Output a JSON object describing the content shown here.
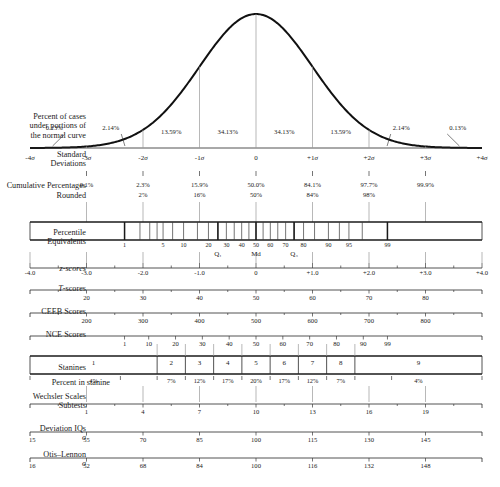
{
  "figure": {
    "geometry": {
      "x_left_sigma": -4,
      "x_right_sigma": 4,
      "plot_left_px": 30,
      "plot_right_px": 482,
      "baseline_y_px": 148
    }
  },
  "rows": {
    "percent_of_cases": {
      "label_lines": [
        "Percent of cases",
        "under portions of",
        "the normal curve"
      ],
      "values": [
        "0.13%",
        "2.14%",
        "13.59%",
        "34.13%",
        "34.13%",
        "13.59%",
        "2.14%",
        "0.13%"
      ]
    },
    "standard_deviations": {
      "label_lines": [
        "Standard",
        "Deviations"
      ],
      "ticks": [
        "-4σ",
        "-3σ",
        "-2σ",
        "-1σ",
        "0",
        "+1σ",
        "+2σ",
        "+3σ",
        "+4σ"
      ]
    },
    "cumulative_percentages": {
      "label": "Cumulative Percentages",
      "values": [
        "0.1%",
        "2.3%",
        "15.9%",
        "50.0%",
        "84.1%",
        "97.7%",
        "99.9%"
      ]
    },
    "rounded": {
      "label": "Rounded",
      "values": [
        "",
        "2%",
        "16%",
        "50%",
        "84%",
        "98%",
        ""
      ]
    },
    "percentile_equivalents": {
      "label_lines": [
        "Percentile",
        "Equivalents"
      ],
      "ticks": [
        "1",
        "5",
        "10",
        "20",
        "30",
        "40",
        "50",
        "60",
        "70",
        "80",
        "90",
        "95",
        "99"
      ],
      "quartiles": [
        "Q₁",
        "Md",
        "Q₃"
      ]
    },
    "z_scores": {
      "label": "z-scores",
      "ticks": [
        "-4.0",
        "-3.0",
        "-2.0",
        "-1.0",
        "0",
        "+1.0",
        "+2.0",
        "+3.0",
        "+4.0"
      ]
    },
    "t_scores": {
      "label": "T-scores",
      "ticks": [
        "20",
        "30",
        "40",
        "50",
        "60",
        "70",
        "80"
      ]
    },
    "ceeb_scores": {
      "label": "CEEB Scores",
      "ticks": [
        "200",
        "300",
        "400",
        "500",
        "600",
        "700",
        "800"
      ]
    },
    "nce_scores": {
      "label": "NCE Scores",
      "ticks": [
        "1",
        "10",
        "20",
        "30",
        "40",
        "50",
        "60",
        "70",
        "80",
        "90",
        "99"
      ]
    },
    "stanines": {
      "label": "Stanines",
      "bands": [
        "1",
        "2",
        "3",
        "4",
        "5",
        "6",
        "7",
        "8",
        "9"
      ]
    },
    "percent_in_stanine": {
      "label": "Percent in stanine",
      "values": [
        "4%",
        "7%",
        "12%",
        "17%",
        "20%",
        "17%",
        "12%",
        "7%",
        "4%"
      ]
    },
    "wechsler": {
      "label_lines": [
        "Wechsler Scales",
        "Subtests"
      ],
      "ticks": [
        "1",
        "4",
        "7",
        "10",
        "13",
        "16",
        "19"
      ]
    },
    "deviation_iqs": {
      "label_lines": [
        "Deviation IQs",
        "σ"
      ],
      "sigma_value": "15",
      "ticks": [
        "55",
        "70",
        "85",
        "100",
        "115",
        "130",
        "145"
      ]
    },
    "otis_lennon": {
      "label_lines": [
        "Otis–Lennon",
        "σ"
      ],
      "sigma_value": "16",
      "ticks": [
        "52",
        "68",
        "84",
        "100",
        "116",
        "132",
        "148"
      ]
    }
  },
  "chart_data": {
    "type": "line",
    "xlabel": "Standard Deviations",
    "ylabel": "",
    "xlim": [
      -4,
      4
    ],
    "grid": false,
    "legend": "none",
    "series": [
      {
        "name": "normal curve",
        "x": [
          -4,
          -3.5,
          -3,
          -2.5,
          -2,
          -1.5,
          -1,
          -0.5,
          0,
          0.5,
          1,
          1.5,
          2,
          2.5,
          3,
          3.5,
          4
        ],
        "y": [
          0.0001,
          0.0009,
          0.0044,
          0.0175,
          0.054,
          0.1295,
          0.242,
          0.3521,
          0.3989,
          0.3521,
          0.242,
          0.1295,
          0.054,
          0.0175,
          0.0044,
          0.0009,
          0.0001
        ]
      }
    ],
    "band_percentages": {
      "bins": [
        "-4σ to -3σ",
        "-3σ to -2σ",
        "-2σ to -1σ",
        "-1σ to 0",
        "0 to +1σ",
        "+1σ to +2σ",
        "+2σ to +3σ",
        "+3σ to +4σ"
      ],
      "values": [
        0.13,
        2.14,
        13.59,
        34.13,
        34.13,
        13.59,
        2.14,
        0.13
      ]
    },
    "scales": [
      {
        "name": "Standard Deviations",
        "x": [
          -4,
          -3,
          -2,
          -1,
          0,
          1,
          2,
          3,
          4
        ],
        "labels": [
          "-4σ",
          "-3σ",
          "-2σ",
          "-1σ",
          "0",
          "+1σ",
          "+2σ",
          "+3σ",
          "+4σ"
        ]
      },
      {
        "name": "Cumulative Percentages",
        "x": [
          -3,
          -2,
          -1,
          0,
          1,
          2,
          3
        ],
        "labels": [
          "0.1%",
          "2.3%",
          "15.9%",
          "50.0%",
          "84.1%",
          "97.7%",
          "99.9%"
        ]
      },
      {
        "name": "Rounded",
        "x": [
          -2,
          -1,
          0,
          1,
          2
        ],
        "labels": [
          "2%",
          "16%",
          "50%",
          "84%",
          "98%"
        ]
      },
      {
        "name": "Percentile Equivalents",
        "x": [
          -2.326,
          -1.645,
          -1.282,
          -0.842,
          -0.524,
          -0.253,
          0,
          0.253,
          0.524,
          0.842,
          1.282,
          1.645,
          2.326
        ],
        "labels": [
          "1",
          "5",
          "10",
          "20",
          "30",
          "40",
          "50",
          "60",
          "70",
          "80",
          "90",
          "95",
          "99"
        ]
      },
      {
        "name": "z-scores",
        "x": [
          -4,
          -3,
          -2,
          -1,
          0,
          1,
          2,
          3,
          4
        ],
        "labels": [
          "-4.0",
          "-3.0",
          "-2.0",
          "-1.0",
          "0",
          "+1.0",
          "+2.0",
          "+3.0",
          "+4.0"
        ]
      },
      {
        "name": "T-scores",
        "x": [
          -3,
          -2,
          -1,
          0,
          1,
          2,
          3
        ],
        "labels": [
          "20",
          "30",
          "40",
          "50",
          "60",
          "70",
          "80"
        ]
      },
      {
        "name": "CEEB Scores",
        "x": [
          -3,
          -2,
          -1,
          0,
          1,
          2,
          3
        ],
        "labels": [
          "200",
          "300",
          "400",
          "500",
          "600",
          "700",
          "800"
        ]
      },
      {
        "name": "NCE Scores",
        "x": [
          -2.326,
          -1.84,
          -1.41,
          -1.0,
          -0.57,
          0,
          0.57,
          1.0,
          1.41,
          1.84,
          2.326
        ],
        "labels": [
          "1",
          "10",
          "20",
          "30",
          "40",
          "50",
          "60",
          "70",
          "80",
          "90",
          "99"
        ]
      },
      {
        "name": "Stanines",
        "x": [
          -1.75,
          -1.25,
          -0.75,
          -0.25,
          0.25,
          0.75,
          1.25,
          1.75
        ],
        "labels": [
          "1|2",
          "2|3",
          "3|4",
          "4|5",
          "5|6",
          "6|7",
          "7|8",
          "8|9"
        ]
      },
      {
        "name": "Percent in stanine",
        "x": [
          -2.4,
          -1.5,
          -1.0,
          -0.5,
          0,
          0.5,
          1.0,
          1.5,
          2.4
        ],
        "labels": [
          "4%",
          "7%",
          "12%",
          "17%",
          "20%",
          "17%",
          "12%",
          "7%",
          "4%"
        ]
      },
      {
        "name": "Wechsler Scales Subtests",
        "x": [
          -3,
          -2,
          -1,
          0,
          1,
          2,
          3
        ],
        "labels": [
          "1",
          "4",
          "7",
          "10",
          "13",
          "16",
          "19"
        ]
      },
      {
        "name": "Deviation IQs",
        "x": [
          -3,
          -2,
          -1,
          0,
          1,
          2,
          3
        ],
        "labels": [
          "55",
          "70",
          "85",
          "100",
          "115",
          "130",
          "145"
        ]
      },
      {
        "name": "Otis–Lennon",
        "x": [
          -3,
          -2,
          -1,
          0,
          1,
          2,
          3
        ],
        "labels": [
          "52",
          "68",
          "84",
          "100",
          "116",
          "132",
          "148"
        ]
      }
    ]
  }
}
